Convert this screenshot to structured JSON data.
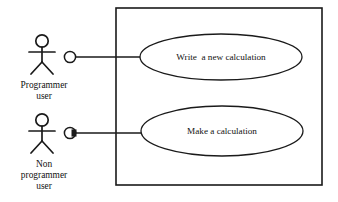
{
  "diagram": {
    "type": "uml-use-case-diagram",
    "background_color": "#ffffff",
    "stroke_color": "#1a1a1a",
    "text_color": "#121212",
    "system_boundary": {
      "label": "",
      "x": 116,
      "y": 8,
      "width": 206,
      "height": 177
    },
    "actors": [
      {
        "id": "programmer-user",
        "label_lines": [
          "Programmer",
          "user"
        ],
        "line1": "Programmer",
        "line2": "user",
        "line3": "",
        "figure": {
          "head_cx": 42,
          "head_cy": 41,
          "head_r": 6.2,
          "body_top_y": 47,
          "body_bottom_y": 62,
          "arm_y": 52,
          "arm_left_x": 29,
          "arm_right_x": 55,
          "leg_left_x": 31,
          "leg_right_x": 53,
          "leg_bottom_y": 74
        },
        "label_x": 44,
        "label_y1": 88,
        "label_y2": 99,
        "connector": {
          "cx": 70,
          "cy": 57,
          "r": 5.6,
          "style": "open-circle",
          "line_to_x": 140,
          "line_y": 57
        }
      },
      {
        "id": "non-programmer-user",
        "label_lines": [
          "Non",
          "programmer",
          "user"
        ],
        "line1": "Non",
        "line2": "programmer",
        "line3": "user",
        "figure": {
          "head_cx": 42,
          "head_cy": 120,
          "head_r": 6.2,
          "body_top_y": 126,
          "body_bottom_y": 141,
          "arm_y": 131,
          "arm_left_x": 29,
          "arm_right_x": 55,
          "leg_left_x": 31,
          "leg_right_x": 53,
          "leg_bottom_y": 153
        },
        "label_x": 44,
        "label_y1": 167,
        "label_y2": 178,
        "label_y3": 189,
        "connector": {
          "cx": 70,
          "cy": 133,
          "r": 5.6,
          "style": "filled-edge-circle",
          "line_to_x": 142,
          "line_y": 133
        }
      }
    ],
    "use_cases": [
      {
        "id": "write-a-new-calculation",
        "label": "Write  a new calculation",
        "cx": 221,
        "cy": 57,
        "rx": 81,
        "ry": 23
      },
      {
        "id": "make-a-calculation",
        "label": "Make a calculation",
        "cx": 222,
        "cy": 131,
        "rx": 81,
        "ry": 25
      }
    ]
  }
}
